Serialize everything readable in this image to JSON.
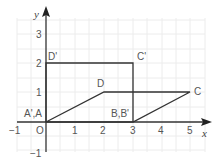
{
  "diagram": {
    "type": "coordinate-plane",
    "axes": {
      "x_label": "x",
      "y_label": "y",
      "origin_label": "O",
      "x_ticks": [
        {
          "value": -1,
          "label": "−1"
        },
        {
          "value": 1,
          "label": "1"
        },
        {
          "value": 2,
          "label": "2"
        },
        {
          "value": 3,
          "label": "3"
        },
        {
          "value": 4,
          "label": "4"
        },
        {
          "value": 5,
          "label": "5"
        }
      ],
      "y_ticks": [
        {
          "value": -1,
          "label": "−1"
        },
        {
          "value": 1,
          "label": "1"
        },
        {
          "value": 2,
          "label": "2"
        },
        {
          "value": 3,
          "label": "3"
        }
      ]
    },
    "shapes": {
      "parallelogram": {
        "vertices": [
          "A(0,0)",
          "B(3,0)",
          "C(5,1)",
          "D(2,1)"
        ]
      },
      "rectangle": {
        "vertices": [
          "A'(0,0)",
          "B'(3,0)",
          "C'(3,2)",
          "D'(0,2)"
        ]
      }
    },
    "point_labels": {
      "AA": "A',A",
      "BB": "B,B'",
      "C": "C",
      "D": "D",
      "Cp": "C'",
      "Dp": "D'"
    },
    "colors": {
      "grid": "#e8e8e8",
      "axis": "#333333",
      "shape": "#333333",
      "text": "#555555"
    }
  }
}
